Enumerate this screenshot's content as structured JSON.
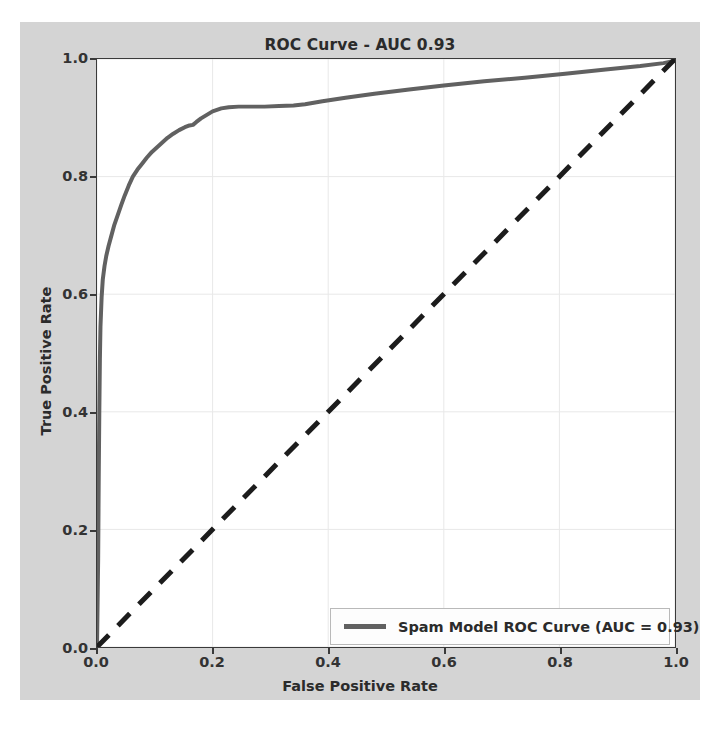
{
  "chart_data": {
    "type": "line",
    "title": "ROC Curve - AUC 0.93",
    "xlabel": "False Positive Rate",
    "ylabel": "True Positive Rate",
    "xlim": [
      0.0,
      1.0
    ],
    "ylim": [
      0.0,
      1.0
    ],
    "xticks": [
      "0.0",
      "0.2",
      "0.4",
      "0.6",
      "0.8",
      "1.0"
    ],
    "xtick_values": [
      0.0,
      0.2,
      0.4,
      0.6,
      0.8,
      1.0
    ],
    "yticks": [
      "0.0",
      "0.2",
      "0.4",
      "0.6",
      "0.8",
      "1.0"
    ],
    "ytick_values": [
      0.0,
      0.2,
      0.4,
      0.6,
      0.8,
      1.0
    ],
    "grid": true,
    "grid_color": "#e8e8e8",
    "legend_position": "lower right",
    "auc": 0.93,
    "series": [
      {
        "name": "Spam Model ROC Curve (AUC = 0.93)",
        "color": "#616161",
        "linestyle": "solid",
        "linewidth": 4,
        "x": [
          0.0,
          0.002,
          0.003,
          0.004,
          0.005,
          0.006,
          0.008,
          0.01,
          0.013,
          0.016,
          0.02,
          0.025,
          0.03,
          0.036,
          0.042,
          0.048,
          0.055,
          0.062,
          0.07,
          0.078,
          0.086,
          0.095,
          0.104,
          0.113,
          0.122,
          0.132,
          0.142,
          0.152,
          0.16,
          0.166,
          0.172,
          0.18,
          0.19,
          0.2,
          0.215,
          0.228,
          0.245,
          0.265,
          0.29,
          0.315,
          0.34,
          0.36,
          0.39,
          0.43,
          0.48,
          0.54,
          0.6,
          0.67,
          0.74,
          0.81,
          0.88,
          0.94,
          0.98,
          1.0
        ],
        "y": [
          0.0,
          0.15,
          0.29,
          0.4,
          0.49,
          0.545,
          0.595,
          0.625,
          0.648,
          0.665,
          0.682,
          0.7,
          0.718,
          0.735,
          0.752,
          0.768,
          0.785,
          0.8,
          0.812,
          0.822,
          0.832,
          0.842,
          0.85,
          0.858,
          0.866,
          0.873,
          0.879,
          0.884,
          0.887,
          0.888,
          0.893,
          0.899,
          0.905,
          0.911,
          0.916,
          0.918,
          0.919,
          0.919,
          0.919,
          0.92,
          0.921,
          0.923,
          0.928,
          0.934,
          0.941,
          0.948,
          0.955,
          0.962,
          0.968,
          0.975,
          0.982,
          0.988,
          0.993,
          0.997
        ]
      },
      {
        "name": "chance-diagonal",
        "color": "#1c1c1c",
        "linestyle": "dashed",
        "linewidth": 5,
        "x": [
          0.0,
          1.0
        ],
        "y": [
          0.0,
          1.0
        ]
      }
    ]
  },
  "legend": {
    "entry_label": "Spam Model ROC Curve (AUC = 0.93)",
    "swatch_color": "#616161"
  }
}
